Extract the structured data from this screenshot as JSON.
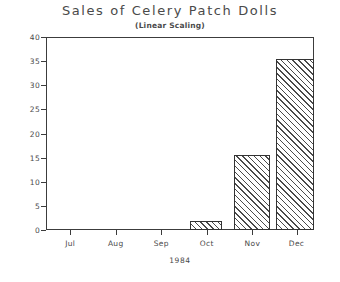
{
  "chart_data": {
    "type": "bar",
    "title": "Sales of Celery Patch Dolls",
    "subtitle": "(Linear Scaling)",
    "xlabel": "1984",
    "ylabel": "",
    "categories": [
      "Jul",
      "Aug",
      "Sep",
      "Oct",
      "Nov",
      "Dec"
    ],
    "values": [
      0,
      0,
      0,
      1.8,
      15.5,
      35.5
    ],
    "ylim": [
      0,
      40
    ],
    "ytick_labels": [
      "0",
      "5",
      "10",
      "15",
      "20",
      "25",
      "30",
      "35",
      "40"
    ],
    "ytick_values": [
      0,
      5,
      10,
      15,
      20,
      25,
      30,
      35,
      40
    ],
    "grid": false,
    "legend": false,
    "bar_fill": "diagonal-hatch",
    "colors": {
      "axis": "#3c3c3c",
      "text": "#4a4a4a",
      "hatch": "#4a4a4a",
      "background": "#ffffff"
    },
    "bar_geometry": [
      {
        "category": "Jul",
        "value": 0,
        "left_pct": 3.0,
        "width_pct": 10.0
      },
      {
        "category": "Aug",
        "value": 0,
        "left_pct": 20.0,
        "width_pct": 10.0
      },
      {
        "category": "Sep",
        "value": 0,
        "left_pct": 37.0,
        "width_pct": 10.0
      },
      {
        "category": "Oct",
        "value": 1.8,
        "left_pct": 53.8,
        "width_pct": 12.0
      },
      {
        "category": "Nov",
        "value": 15.5,
        "left_pct": 70.2,
        "width_pct": 13.4
      },
      {
        "category": "Dec",
        "value": 35.5,
        "left_pct": 86.0,
        "width_pct": 14.0
      }
    ],
    "xtick_positions_pct": [
      9.0,
      26.0,
      43.0,
      60.0,
      77.0,
      93.5
    ]
  }
}
